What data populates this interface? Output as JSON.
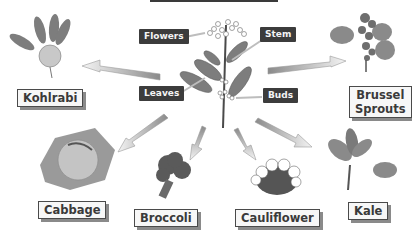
{
  "diagram": {
    "center_plant": "wild-cabbage-plant",
    "parts": [
      {
        "id": "flowers",
        "label": "Flowers"
      },
      {
        "id": "stem",
        "label": "Stem"
      },
      {
        "id": "leaves",
        "label": "Leaves"
      },
      {
        "id": "buds",
        "label": "Buds"
      }
    ],
    "vegetables": [
      {
        "id": "kohlrabi",
        "label": "Kohlrabi"
      },
      {
        "id": "brussel-sprouts",
        "label_line1": "Brussel",
        "label_line2": "Sprouts"
      },
      {
        "id": "cabbage",
        "label": "Cabbage"
      },
      {
        "id": "broccoli",
        "label": "Broccoli"
      },
      {
        "id": "cauliflower",
        "label": "Cauliflower"
      },
      {
        "id": "kale",
        "label": "Kale"
      }
    ],
    "colors": {
      "label_dark": "#3c3c3c",
      "label_box_border": "#4a4a4a",
      "arrow_dark": "#8a8a8a",
      "arrow_light": "#f2f2f2",
      "leaf": "#7d7d7d"
    }
  }
}
